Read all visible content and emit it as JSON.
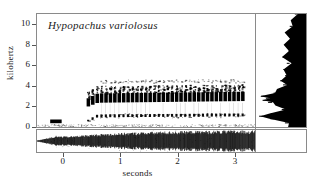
{
  "title": "Hypopachus variolosus",
  "axes": {
    "ylabel": "kilohertz",
    "xlabel": "seconds",
    "yticks": [
      "0",
      "2",
      "4",
      "6",
      "8",
      "10"
    ],
    "xticks": [
      "0",
      "1",
      "2",
      "3"
    ]
  },
  "chart_data": {
    "type": "heatmap",
    "title": "Hypopachus variolosus",
    "subtitle": "",
    "xlabel": "seconds",
    "ylabel": "kilohertz",
    "xlim": [
      -0.45,
      3.35
    ],
    "ylim": [
      0,
      11
    ],
    "ytick_values": [
      0,
      2,
      4,
      6,
      8,
      10
    ],
    "xtick_values": [
      0,
      1,
      2,
      3
    ],
    "grid": false,
    "legend": false,
    "panels": [
      {
        "name": "spectrogram",
        "type": "heatmap",
        "xlabel": "seconds",
        "ylabel": "kilohertz",
        "call_start_s": 0.42,
        "call_end_s": 3.18,
        "intro_note": {
          "start_s": -0.22,
          "end_s": -0.02,
          "freq_khz": 0.55
        },
        "pulse_rate_per_s": 13,
        "bands": [
          {
            "name": "dominant",
            "freq_low_khz": 2.35,
            "freq_high_khz": 4.0,
            "intensity": 1.0
          },
          {
            "name": "lower-harmonic",
            "freq_low_khz": 0.85,
            "freq_high_khz": 1.3,
            "intensity": 0.8
          },
          {
            "name": "upper-sideband",
            "freq_low_khz": 4.3,
            "freq_high_khz": 4.6,
            "intensity": 0.35
          }
        ]
      },
      {
        "name": "power-spectrum",
        "type": "area",
        "orientation": "horizontal-frequency-vertical",
        "ylabel": "kilohertz",
        "peaks_khz": [
          1.05,
          2.6,
          3.0
        ],
        "frequency_khz": [
          0,
          0.4,
          0.8,
          1.05,
          1.3,
          1.7,
          2.1,
          2.4,
          2.6,
          2.8,
          3.0,
          3.3,
          3.7,
          4.1,
          4.5,
          5.0,
          5.6,
          6.2,
          6.8,
          7.4,
          8.0,
          8.6,
          9.2,
          9.8,
          10.4,
          11.0
        ],
        "relative_amplitude": [
          0.3,
          0.42,
          0.7,
          0.95,
          0.72,
          0.46,
          0.58,
          0.74,
          0.88,
          0.8,
          0.92,
          0.66,
          0.52,
          0.45,
          0.52,
          0.4,
          0.46,
          0.38,
          0.44,
          0.36,
          0.4,
          0.33,
          0.36,
          0.3,
          0.26,
          0.2
        ]
      },
      {
        "name": "oscillogram",
        "type": "area",
        "xlabel": "seconds",
        "envelope_x_s": [
          -0.45,
          -0.25,
          -0.1,
          0.1,
          0.4,
          0.7,
          1.0,
          1.4,
          1.8,
          2.2,
          2.6,
          3.0,
          3.18
        ],
        "envelope_amplitude": [
          0.05,
          0.3,
          0.45,
          0.42,
          0.55,
          0.66,
          0.74,
          0.82,
          0.88,
          0.92,
          0.95,
          0.97,
          0.96
        ]
      }
    ]
  },
  "colors": {
    "ink": "#111111",
    "frame": "#8a8a8a",
    "background": "#ffffff"
  }
}
